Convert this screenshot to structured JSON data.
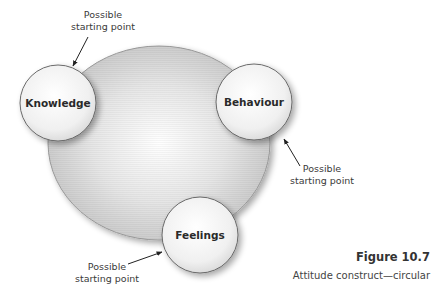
{
  "diagram": {
    "type": "cycle",
    "nodes": [
      {
        "id": "knowledge",
        "label": "Knowledge",
        "cx": 58,
        "cy": 103,
        "r": 38
      },
      {
        "id": "behaviour",
        "label": "Behaviour",
        "cx": 254,
        "cy": 102,
        "r": 38
      },
      {
        "id": "feelings",
        "label": "Feelings",
        "cx": 200,
        "cy": 235,
        "r": 38
      }
    ],
    "annotations": [
      {
        "target": "knowledge",
        "line1": "Possible",
        "line2": "starting point"
      },
      {
        "target": "behaviour",
        "line1": "Possible",
        "line2": "starting point"
      },
      {
        "target": "feelings",
        "line1": "Possible",
        "line2": "starting point"
      }
    ],
    "colors": {
      "background": "#ffffff",
      "ellipse_fill": "#dcdcdc",
      "ellipse_stroke": "#9a9a9a",
      "node_fill": "#f2f2f2",
      "node_stroke": "#6a6a6a",
      "text": "#2a2a2a"
    }
  },
  "figure": {
    "number": "Figure 10.7",
    "caption": "Attitude construct—circular"
  }
}
